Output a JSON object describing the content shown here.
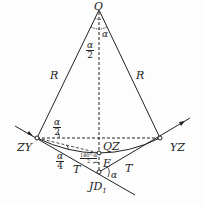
{
  "diagram": {
    "labels": {
      "center": "O",
      "radius_left": "R",
      "radius_right": "R",
      "curve_start": "ZY",
      "curve_end": "YZ",
      "curve_mid": "QZ",
      "external_distance": "E",
      "tangent_left": "T",
      "tangent_right": "T",
      "intersection": "JD",
      "intersection_sub": "1",
      "deflection_angle": "α",
      "central_angle": "α"
    },
    "fractions": {
      "half_central": {
        "num": "α",
        "den": "2"
      },
      "half_at_zy": {
        "num": "α",
        "den": "2"
      },
      "quarter_at_zy": {
        "num": "α",
        "den": "4"
      },
      "angle_at_jd": {
        "num": "180°-α",
        "den": "2"
      }
    },
    "colors": {
      "line": "#222222",
      "background": "#fdfdfd"
    }
  }
}
